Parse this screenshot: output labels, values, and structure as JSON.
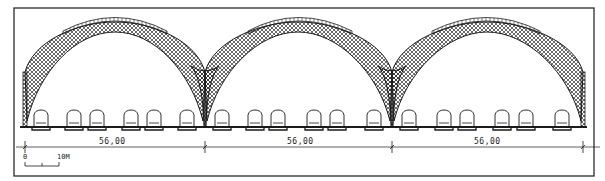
{
  "drawing": {
    "type": "architectural-section",
    "subject": "three-bay arched train shed cross-section",
    "colors": {
      "ink": "#1a1a1a",
      "paper": "#ffffff",
      "lattice": "#2a2a2a"
    },
    "frame": {
      "x": 14,
      "y": 8,
      "w": 580,
      "h": 168
    },
    "ground_y": 127,
    "ground_x": [
      20,
      587
    ],
    "pillars": [
      25,
      205,
      392,
      583
    ],
    "arches": [
      {
        "left": 25,
        "right": 205,
        "crown_x": 115,
        "crown_y": 22,
        "skylight": [
          63,
          167
        ]
      },
      {
        "left": 205,
        "right": 392,
        "crown_x": 298,
        "crown_y": 22,
        "skylight": [
          248,
          352
        ]
      },
      {
        "left": 392,
        "right": 583,
        "crown_x": 487,
        "crown_y": 22,
        "skylight": [
          432,
          540
        ]
      }
    ],
    "trains_x": [
      [
        34,
        67,
        90,
        124,
        147,
        180
      ],
      [
        215,
        248,
        271,
        307,
        330,
        367
      ],
      [
        402,
        437,
        460,
        495,
        519,
        555
      ]
    ],
    "train_width": 14,
    "dimensions": {
      "y": 147,
      "ticks": [
        25,
        205,
        392,
        583
      ],
      "labels": [
        {
          "text": "56,00",
          "x": 99
        },
        {
          "text": "56,00",
          "x": 287
        },
        {
          "text": "56,00",
          "x": 474
        }
      ]
    },
    "scale_bar": {
      "zero_label": "0",
      "end_label": "10M",
      "x0": 25,
      "x1": 59,
      "mid": 42,
      "y": 166
    }
  }
}
